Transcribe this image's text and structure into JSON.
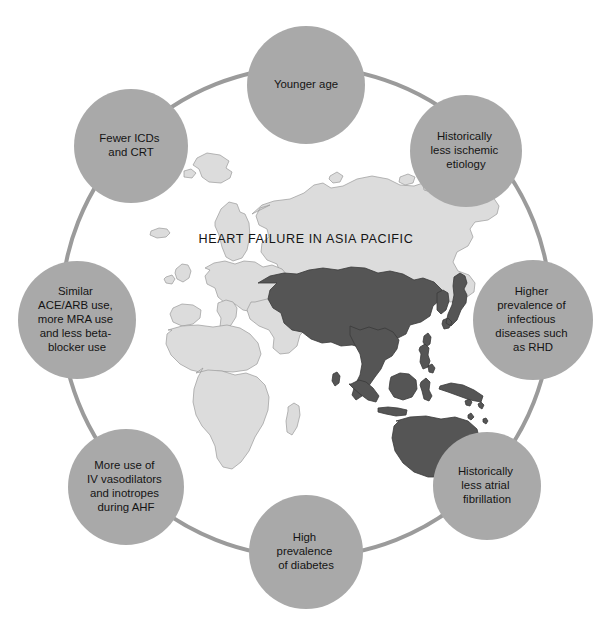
{
  "figure": {
    "title": "HEART FAILURE IN ASIA PACIFIC",
    "background_color": "#ffffff"
  },
  "colors": {
    "ring_stroke": "#9b9b9b",
    "node_fill": "#a9a9a9",
    "node_text": "#141414",
    "map_other_land": "#dcdcdc",
    "map_other_border": "#9a9a9a",
    "map_highlight": "#555555",
    "map_highlight_border": "#3a3a3a"
  },
  "ring": {
    "center_x": 306,
    "center_y": 312,
    "radius": 245,
    "stroke_width": 4
  },
  "nodes": [
    {
      "id": "younger-age",
      "angle_deg": -90,
      "cx": 306,
      "cy": 85,
      "r": 59,
      "lines": [
        "Younger age"
      ]
    },
    {
      "id": "historically-less-ischemic-etiology",
      "angle_deg": -45,
      "cx": 466,
      "cy": 151,
      "r": 56,
      "lines": [
        "Historically",
        "less ischemic",
        "etiology"
      ]
    },
    {
      "id": "higher-prevalence-infectious-rhd",
      "angle_deg": 0,
      "cx": 533,
      "cy": 320,
      "r": 60,
      "lines": [
        "Higher",
        "prevalence of",
        "infectious",
        "diseases such",
        "as RHD"
      ]
    },
    {
      "id": "historically-less-atrial-fibrillation",
      "angle_deg": 45,
      "cx": 487,
      "cy": 486,
      "r": 54,
      "lines": [
        "Historically",
        "less atrial",
        "fibrillation"
      ]
    },
    {
      "id": "high-prevalence-of-diabetes",
      "angle_deg": 90,
      "cx": 306,
      "cy": 552,
      "r": 57,
      "lines": [
        "High",
        "prevalence",
        "of diabetes"
      ]
    },
    {
      "id": "more-iv-vasodilators-inotropes-ahf",
      "angle_deg": 135,
      "cx": 126,
      "cy": 487,
      "r": 58,
      "lines": [
        "More use of",
        "IV vasodilators",
        "and inotropes",
        "during AHF"
      ]
    },
    {
      "id": "similar-ace-arb-mra-betablocker",
      "angle_deg": 180,
      "cx": 77,
      "cy": 320,
      "r": 59,
      "lines": [
        "Similar",
        "ACE/ARB use,",
        "more MRA use",
        "and less beta-",
        "blocker use"
      ]
    },
    {
      "id": "fewer-icds-and-crt",
      "angle_deg": -135,
      "cx": 131,
      "cy": 146,
      "r": 57,
      "lines": [
        "Fewer ICDs",
        "and CRT"
      ]
    }
  ],
  "map": {
    "name": "world-map-asia-pacific-highlighted",
    "highlighted_regions": [
      "China",
      "India",
      "Pakistan",
      "Afghanistan",
      "Iran",
      "Kazakhstan",
      "Uzbekistan",
      "Turkmenistan",
      "Kyrgyzstan",
      "Tajikistan",
      "Mongolia",
      "Nepal",
      "Bhutan",
      "Bangladesh",
      "Myanmar",
      "Thailand",
      "Laos",
      "Vietnam",
      "Cambodia",
      "Malaysia",
      "Indonesia",
      "Philippines",
      "Japan",
      "South Korea",
      "North Korea",
      "Papua New Guinea",
      "Australia",
      "New Zealand",
      "Sri Lanka",
      "Taiwan"
    ],
    "other_regions": [
      "Europe",
      "Africa",
      "Russia",
      "Greenland",
      "Middle East"
    ]
  }
}
